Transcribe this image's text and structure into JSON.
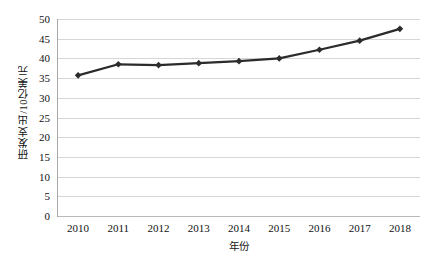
{
  "chart_data": {
    "type": "line",
    "title": "",
    "xlabel": "年份",
    "ylabel": "研发支出/10亿美元",
    "categories": [
      "2010",
      "2011",
      "2012",
      "2013",
      "2014",
      "2015",
      "2016",
      "2017",
      "2018"
    ],
    "x": [
      2010,
      2011,
      2012,
      2013,
      2014,
      2015,
      2016,
      2017,
      2018
    ],
    "values": [
      35.7,
      38.5,
      38.3,
      38.8,
      39.3,
      40.0,
      42.2,
      44.5,
      47.5
    ],
    "series": [
      {
        "name": "研发支出",
        "values": [
          35.7,
          38.5,
          38.3,
          38.8,
          39.3,
          40.0,
          42.2,
          44.5,
          47.5
        ]
      }
    ],
    "ylim": [
      0,
      50
    ],
    "ytick_step": 5,
    "yticks": [
      0,
      5,
      10,
      15,
      20,
      25,
      30,
      35,
      40,
      45,
      50
    ],
    "ytick_labels": [
      "0",
      "5",
      "10",
      "15",
      "20",
      "25",
      "30",
      "35",
      "40",
      "45",
      "50"
    ],
    "grid": "horizontal",
    "grid_color": "#d6d6d6",
    "legend": "none",
    "marker": "filled-diamond",
    "line_color": "#2b2b2b",
    "marker_color": "#2b2b2b",
    "background": "#ffffff"
  }
}
